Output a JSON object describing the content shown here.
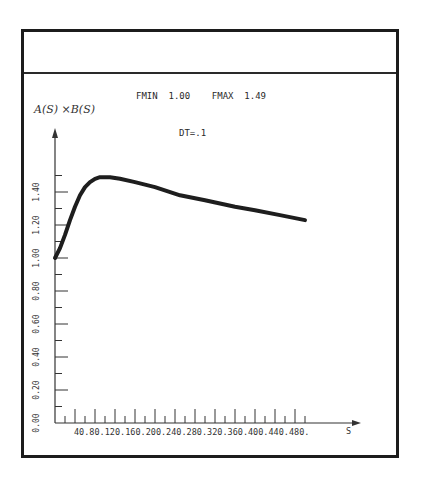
{
  "chart_data": {
    "type": "line",
    "title": "FMIN  1.00    FMAX  1.49",
    "subtitle": "DT=.1",
    "fmin_label": "FMIN",
    "fmin_value": "1.00",
    "fmax_label": "FMAX",
    "fmax_value": "1.49",
    "dt_label": "DT=.1",
    "xlabel": "S",
    "ylabel": "A(S) × B(S)",
    "xlim": [
      0,
      560
    ],
    "ylim": [
      0.0,
      1.5
    ],
    "grid": false,
    "x_ticks": [
      "40.",
      "80.",
      "120.",
      "160.",
      "200.",
      "240.",
      "280.",
      "320.",
      "360.",
      "400.",
      "440.",
      "480."
    ],
    "x_tick_values": [
      40,
      80,
      120,
      160,
      200,
      240,
      280,
      320,
      360,
      400,
      440,
      480
    ],
    "y_ticks": [
      "0.00",
      "0.20",
      "0.40",
      "0.60",
      "0.80",
      "1.00",
      "1.20",
      "1.40"
    ],
    "y_tick_values": [
      0.0,
      0.2,
      0.4,
      0.6,
      0.8,
      1.0,
      1.2,
      1.4
    ],
    "series": [
      {
        "name": "A(S)×B(S)",
        "x": [
          0,
          10,
          20,
          30,
          40,
          50,
          60,
          70,
          80,
          90,
          100,
          110,
          130,
          160,
          200,
          250,
          300,
          360,
          400,
          450,
          500
        ],
        "y": [
          1.0,
          1.06,
          1.14,
          1.23,
          1.31,
          1.38,
          1.43,
          1.46,
          1.48,
          1.49,
          1.49,
          1.49,
          1.48,
          1.46,
          1.43,
          1.38,
          1.35,
          1.31,
          1.29,
          1.26,
          1.23
        ]
      }
    ]
  },
  "labels": {
    "ylabel": "A(S) ×B(S)",
    "xlabel": "S",
    "header": "FMIN  1.00    FMAX  1.49",
    "dt": "DT=.1"
  }
}
